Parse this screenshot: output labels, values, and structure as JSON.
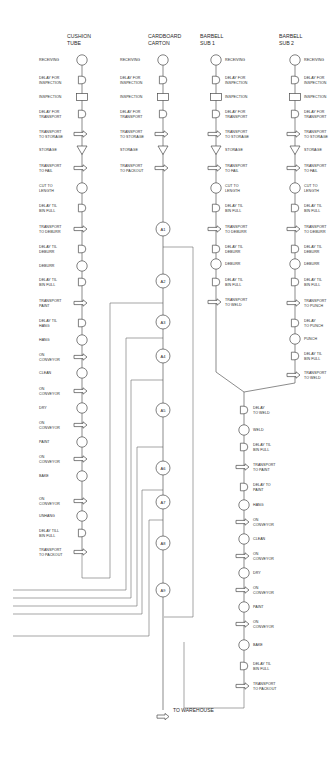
{
  "diagram": {
    "type": "flow-process-chart",
    "columns": [
      {
        "id": "cushion-tube",
        "title_lines": [
          "CUSHION",
          "TUBE"
        ],
        "x": 82,
        "label_side": "left",
        "steps": [
          {
            "y": 60,
            "shape": "operation",
            "label": [
              "RECEIVING"
            ]
          },
          {
            "y": 80,
            "shape": "delay",
            "label": [
              "DELAY FOR",
              "INSPECTION"
            ]
          },
          {
            "y": 97,
            "shape": "inspection",
            "label": [
              "INSPECTION"
            ]
          },
          {
            "y": 114,
            "shape": "delay",
            "label": [
              "DELAY FOR",
              "TRANSPORT"
            ]
          },
          {
            "y": 134,
            "shape": "transport",
            "label": [
              "TRANSPORT",
              "TO STORAGE"
            ]
          },
          {
            "y": 150,
            "shape": "storage",
            "label": [
              "STORAGE"
            ]
          },
          {
            "y": 168,
            "shape": "transport",
            "label": [
              "TRANSPORT",
              "TO FAIL"
            ]
          },
          {
            "y": 188,
            "shape": "operation",
            "label": [
              "CUT TO",
              "LENGTH"
            ]
          },
          {
            "y": 208,
            "shape": "delay",
            "label": [
              "DELAY TIL",
              "BIN FULL"
            ]
          },
          {
            "y": 229,
            "shape": "transport",
            "label": [
              "TRANSPORT",
              "TO DEBURR"
            ]
          },
          {
            "y": 249,
            "shape": "delay",
            "label": [
              "DELAY TIL",
              "DEBURR"
            ]
          },
          {
            "y": 266,
            "shape": "operation",
            "label": [
              "DEBURR"
            ]
          },
          {
            "y": 282,
            "shape": "delay",
            "label": [
              "DELAY TIL",
              "BIN FULL"
            ]
          },
          {
            "y": 303,
            "shape": "transport",
            "label": [
              "TRANSPORT",
              "PAINT"
            ]
          },
          {
            "y": 323,
            "shape": "delay",
            "label": [
              "DELAY TIL",
              "HANG"
            ]
          },
          {
            "y": 340,
            "shape": "operation",
            "label": [
              "HANG"
            ]
          },
          {
            "y": 357,
            "shape": "transport",
            "label": [
              "ON",
              "CONVEYOR"
            ]
          },
          {
            "y": 373,
            "shape": "operation",
            "label": [
              "CLEAN"
            ]
          },
          {
            "y": 391,
            "shape": "transport",
            "label": [
              "ON",
              "CONVEYOR"
            ]
          },
          {
            "y": 408,
            "shape": "operation",
            "label": [
              "DRY"
            ]
          },
          {
            "y": 425,
            "shape": "transport",
            "label": [
              "ON",
              "CONVEYOR"
            ]
          },
          {
            "y": 442,
            "shape": "operation",
            "label": [
              "PAINT"
            ]
          },
          {
            "y": 459,
            "shape": "transport",
            "label": [
              "ON",
              "CONVEYOR"
            ]
          },
          {
            "y": 476,
            "shape": "operation",
            "label": [
              "BAKE"
            ]
          },
          {
            "y": 501,
            "shape": "transport",
            "label": [
              "ON",
              "CONVEYOR"
            ]
          },
          {
            "y": 516,
            "shape": "operation",
            "label": [
              "UNHANG"
            ]
          },
          {
            "y": 533,
            "shape": "delay",
            "label": [
              "DELAY TILL",
              "BIN FULL"
            ]
          },
          {
            "y": 552,
            "shape": "transport",
            "label": [
              "TRANSPORT",
              "TO PACKOUT"
            ]
          }
        ]
      },
      {
        "id": "cardboard-carton",
        "title_lines": [
          "CARDBOARD",
          "CARTON"
        ],
        "x": 163,
        "label_side": "left",
        "steps": [
          {
            "y": 60,
            "shape": "operation",
            "label": [
              "RECEIVING"
            ]
          },
          {
            "y": 80,
            "shape": "delay",
            "label": [
              "DELAY FOR",
              "INSPECTION"
            ]
          },
          {
            "y": 97,
            "shape": "inspection",
            "label": [
              "INSPECTION"
            ]
          },
          {
            "y": 114,
            "shape": "delay",
            "label": [
              "DELAY FOR",
              "TRANSPORT"
            ]
          },
          {
            "y": 134,
            "shape": "transport",
            "label": [
              "TRANSPORT",
              "TO STORAGE"
            ]
          },
          {
            "y": 150,
            "shape": "storage",
            "label": [
              "STORAGE"
            ]
          },
          {
            "y": 168,
            "shape": "transport",
            "label": [
              "TRANSPORT",
              "TO PACKOUT"
            ]
          }
        ]
      },
      {
        "id": "barbell-sub-1",
        "title_lines": [
          "BARBELL",
          "SUB 1"
        ],
        "x": 216,
        "label_side": "right",
        "steps": [
          {
            "y": 60,
            "shape": "operation",
            "label": [
              "RECEIVING"
            ]
          },
          {
            "y": 80,
            "shape": "delay",
            "label": [
              "DELAY FOR",
              "INSPECTION"
            ]
          },
          {
            "y": 97,
            "shape": "inspection",
            "label": [
              "INSPECTION"
            ]
          },
          {
            "y": 114,
            "shape": "delay",
            "label": [
              "DELAY FOR",
              "TRANSPORT"
            ]
          },
          {
            "y": 134,
            "shape": "transport",
            "label": [
              "TRANSPORT",
              "TO STORAGE"
            ]
          },
          {
            "y": 150,
            "shape": "storage",
            "label": [
              "STORAGE"
            ]
          },
          {
            "y": 168,
            "shape": "transport",
            "label": [
              "TRANSPORT",
              "TO FAIL"
            ]
          },
          {
            "y": 188,
            "shape": "operation",
            "label": [
              "CUT TO",
              "LENGTH"
            ]
          },
          {
            "y": 208,
            "shape": "delay",
            "label": [
              "DELAY TIL",
              "BIN FULL"
            ]
          },
          {
            "y": 229,
            "shape": "transport",
            "label": [
              "TRANSPORT",
              "TO DEBURR"
            ]
          },
          {
            "y": 249,
            "shape": "delay",
            "label": [
              "DELAY TIL",
              "DEBURR"
            ]
          },
          {
            "y": 264,
            "shape": "operation",
            "label": [
              "DEBURR"
            ]
          },
          {
            "y": 282,
            "shape": "delay",
            "label": [
              "DELAY TIL",
              "BIN FULL"
            ]
          },
          {
            "y": 302,
            "shape": "transport",
            "label": [
              "TRANSPORT",
              "TO WELD"
            ]
          }
        ]
      },
      {
        "id": "barbell-sub-2",
        "title_lines": [
          "BARBELL",
          "SUB 2"
        ],
        "x": 295,
        "label_side": "right",
        "steps": [
          {
            "y": 60,
            "shape": "operation",
            "label": [
              "RECEIVING"
            ]
          },
          {
            "y": 80,
            "shape": "delay",
            "label": [
              "DELAY FOR",
              "INSPECTION"
            ]
          },
          {
            "y": 97,
            "shape": "inspection",
            "label": [
              "INSPECTION"
            ]
          },
          {
            "y": 114,
            "shape": "delay",
            "label": [
              "DELAY FOR",
              "TRANSPORT"
            ]
          },
          {
            "y": 134,
            "shape": "transport",
            "label": [
              "TRANSPORT",
              "TO STORAGE"
            ]
          },
          {
            "y": 150,
            "shape": "storage",
            "label": [
              "STORAGE"
            ]
          },
          {
            "y": 168,
            "shape": "transport",
            "label": [
              "TRANSPORT",
              "TO FAIL"
            ]
          },
          {
            "y": 188,
            "shape": "operation",
            "label": [
              "CUT TO",
              "LENGTH"
            ]
          },
          {
            "y": 208,
            "shape": "delay",
            "label": [
              "DELAY TIL",
              "BIN FULL"
            ]
          },
          {
            "y": 229,
            "shape": "transport",
            "label": [
              "TRANSPORT",
              "TO DEBURR"
            ]
          },
          {
            "y": 249,
            "shape": "delay",
            "label": [
              "DELAY TIL",
              "DEBURR"
            ]
          },
          {
            "y": 264,
            "shape": "operation",
            "label": [
              "DEBURR"
            ]
          },
          {
            "y": 282,
            "shape": "delay",
            "label": [
              "DELAY TIL",
              "BIN FULL"
            ]
          },
          {
            "y": 303,
            "shape": "transport",
            "label": [
              "TRANSPORT",
              "TO PUNCH"
            ]
          },
          {
            "y": 323,
            "shape": "delay",
            "label": [
              "DELAY",
              "TO PUNCH"
            ]
          },
          {
            "y": 339,
            "shape": "operation",
            "label": [
              "PUNCH"
            ]
          },
          {
            "y": 356,
            "shape": "delay",
            "label": [
              "DELAY TIL",
              "BIN FULL"
            ]
          },
          {
            "y": 375,
            "shape": "transport",
            "label": [
              "TRANSPORT",
              "TO WELD"
            ]
          }
        ]
      },
      {
        "id": "barbell-assembly",
        "title_lines": [],
        "x": 244,
        "label_side": "right",
        "steps": [
          {
            "y": 410,
            "shape": "delay",
            "label": [
              "DELAY",
              "TO WELD"
            ]
          },
          {
            "y": 430,
            "shape": "operation",
            "label": [
              "WELD"
            ]
          },
          {
            "y": 447,
            "shape": "delay",
            "label": [
              "DELAY TIL",
              "BIN FULL"
            ]
          },
          {
            "y": 467,
            "shape": "transport",
            "label": [
              "TRANSPORT",
              "TO PAINT"
            ]
          },
          {
            "y": 487,
            "shape": "delay",
            "label": [
              "DELAY TO",
              "PAINT"
            ]
          },
          {
            "y": 505,
            "shape": "operation",
            "label": [
              "HANG"
            ]
          },
          {
            "y": 522,
            "shape": "transport",
            "label": [
              "ON",
              "CONVEYOR"
            ]
          },
          {
            "y": 539,
            "shape": "operation",
            "label": [
              "CLEAN"
            ]
          },
          {
            "y": 556,
            "shape": "transport",
            "label": [
              "ON",
              "CONVEYOR"
            ]
          },
          {
            "y": 573,
            "shape": "operation",
            "label": [
              "DRY"
            ]
          },
          {
            "y": 590,
            "shape": "transport",
            "label": [
              "ON",
              "CONVEYOR"
            ]
          },
          {
            "y": 607,
            "shape": "operation",
            "label": [
              "PAINT"
            ]
          },
          {
            "y": 624,
            "shape": "transport",
            "label": [
              "ON",
              "CONVEYOR"
            ]
          },
          {
            "y": 645,
            "shape": "operation",
            "label": [
              "BAKE"
            ]
          },
          {
            "y": 666,
            "shape": "delay",
            "label": [
              "DELAY TIL",
              "BIN FULL"
            ]
          },
          {
            "y": 686,
            "shape": "transport",
            "label": [
              "TRANSPORT",
              "TO PACKOUT"
            ]
          }
        ]
      }
    ],
    "assembly_nodes": [
      {
        "label": "A1",
        "y": 229
      },
      {
        "label": "A2",
        "y": 281
      },
      {
        "label": "A3",
        "y": 322
      },
      {
        "label": "A4",
        "y": 356
      },
      {
        "label": "A5",
        "y": 410
      },
      {
        "label": "A6",
        "y": 468
      },
      {
        "label": "A7",
        "y": 502
      },
      {
        "label": "A8",
        "y": 543
      },
      {
        "label": "A9",
        "y": 590
      }
    ],
    "assembly_x": 163,
    "end_label": "TO WAREHOUSE",
    "end_y": 710,
    "colors": {
      "line": "#5a5a5a",
      "text": "#2a2a2a",
      "background": "#ffffff"
    }
  }
}
